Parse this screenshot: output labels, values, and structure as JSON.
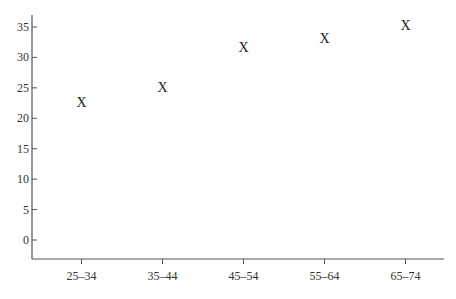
{
  "chart_data": {
    "type": "scatter",
    "title": "",
    "xlabel": "",
    "ylabel": "",
    "categories": [
      "25–34",
      "35–44",
      "45–54",
      "55–64",
      "65–74"
    ],
    "values": [
      22.7,
      25.1,
      31.7,
      33.2,
      35.3
    ],
    "marker": "X",
    "ylim": [
      -3,
      37
    ],
    "yticks": [
      0,
      5,
      10,
      15,
      20,
      25,
      30,
      35
    ],
    "grid": false,
    "legend": null
  },
  "colors": {
    "axis": "#555555",
    "text": "#333333",
    "marker": "#222222"
  }
}
